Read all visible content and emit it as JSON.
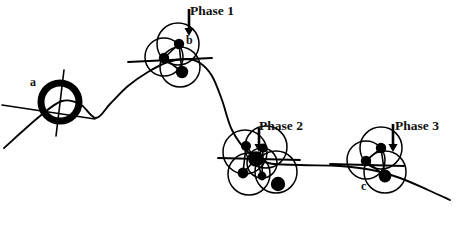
{
  "figure": {
    "type": "scientific-line-diagram",
    "background_color": "#ffffff",
    "ink_color": "#000000",
    "width": 456,
    "height": 229
  },
  "labels": {
    "phase1": "Phase 1",
    "phase2": "Phase 2",
    "phase3": "Phase 3",
    "a": "a",
    "b": "b",
    "c": "c"
  },
  "annotations": {
    "arrow1_name": "down-arrow-phase-1",
    "arrow2_name": "down-arrow-phase-2",
    "arrow3_name": "down-arrow-phase-3"
  },
  "chart_data": {
    "type": "scatter",
    "xlabel": "",
    "ylabel": "",
    "xlim": [
      0,
      456
    ],
    "ylim": [
      0,
      229
    ],
    "grid": false,
    "legend": "none",
    "trajectory": {
      "name": "main-path",
      "points": [
        [
          4,
          148
        ],
        [
          40,
          116
        ],
        [
          62,
          101
        ],
        [
          80,
          104
        ],
        [
          96,
          118
        ],
        [
          110,
          104
        ],
        [
          128,
          86
        ],
        [
          148,
          72
        ],
        [
          168,
          62
        ],
        [
          186,
          59
        ],
        [
          200,
          63
        ],
        [
          212,
          76
        ],
        [
          222,
          100
        ],
        [
          232,
          130
        ],
        [
          248,
          152
        ],
        [
          268,
          163
        ],
        [
          300,
          165
        ],
        [
          340,
          166
        ],
        [
          372,
          170
        ],
        [
          400,
          178
        ],
        [
          428,
          190
        ],
        [
          450,
          200
        ]
      ]
    },
    "clusters": [
      {
        "name": "node-a",
        "label": "a",
        "center": [
          60,
          102
        ],
        "ring": {
          "r": 19,
          "stroke_width": 7
        },
        "cross_lines": [
          {
            "x1": 2,
            "y1": 105,
            "x2": 95,
            "y2": 119
          },
          {
            "x1": 64,
            "y1": 70,
            "x2": 56,
            "y2": 136
          }
        ]
      },
      {
        "name": "phase-1-cluster",
        "label": "Phase 1",
        "arrow": {
          "x": 189,
          "y_start": 9,
          "y_end": 36
        },
        "circles": [
          {
            "cx": 178,
            "cy": 44,
            "r": 21
          },
          {
            "cx": 164,
            "cy": 57,
            "r": 19
          },
          {
            "cx": 180,
            "cy": 67,
            "r": 20
          }
        ],
        "dots": [
          {
            "cx": 179,
            "cy": 44,
            "r": 5.2
          },
          {
            "cx": 164,
            "cy": 58,
            "r": 5.2
          },
          {
            "cx": 182,
            "cy": 72,
            "r": 6.2
          }
        ],
        "bonds": [
          {
            "x1": 179,
            "y1": 44,
            "x2": 164,
            "y2": 58
          },
          {
            "x1": 179,
            "y1": 44,
            "x2": 182,
            "y2": 72
          },
          {
            "x1": 164,
            "y1": 58,
            "x2": 182,
            "y2": 72
          }
        ],
        "axis_line": {
          "x1": 128,
          "y1": 62,
          "x2": 212,
          "y2": 58
        }
      },
      {
        "name": "phase-2-cluster",
        "label": "Phase 2",
        "arrow": {
          "x": 259,
          "y_start": 128,
          "y_end": 152
        },
        "circles": [
          {
            "cx": 245,
            "cy": 152,
            "r": 22
          },
          {
            "cx": 266,
            "cy": 147,
            "r": 21
          },
          {
            "cx": 249,
            "cy": 174,
            "r": 21
          },
          {
            "cx": 276,
            "cy": 172,
            "r": 21
          },
          {
            "cx": 262,
            "cy": 163,
            "r": 15
          }
        ],
        "dots": [
          {
            "cx": 246,
            "cy": 146,
            "r": 5.0
          },
          {
            "cx": 263,
            "cy": 148,
            "r": 4.6
          },
          {
            "cx": 256,
            "cy": 159,
            "r": 7.8
          },
          {
            "cx": 243,
            "cy": 173,
            "r": 5.4
          },
          {
            "cx": 262,
            "cy": 176,
            "r": 4.4
          },
          {
            "cx": 278,
            "cy": 184,
            "r": 7.2
          }
        ],
        "bonds": [
          {
            "x1": 246,
            "y1": 146,
            "x2": 256,
            "y2": 159
          },
          {
            "x1": 263,
            "y1": 148,
            "x2": 256,
            "y2": 159
          },
          {
            "x1": 243,
            "y1": 173,
            "x2": 256,
            "y2": 159
          },
          {
            "x1": 262,
            "y1": 176,
            "x2": 256,
            "y2": 159
          },
          {
            "x1": 246,
            "y1": 146,
            "x2": 243,
            "y2": 173
          },
          {
            "x1": 263,
            "y1": 148,
            "x2": 262,
            "y2": 176
          }
        ],
        "axis_line": {
          "x1": 218,
          "y1": 158,
          "x2": 300,
          "y2": 160
        }
      },
      {
        "name": "phase-3-cluster",
        "label": "Phase 3",
        "arrow": {
          "x": 393,
          "y_start": 124,
          "y_end": 152
        },
        "circles": [
          {
            "cx": 381,
            "cy": 148,
            "r": 21
          },
          {
            "cx": 366,
            "cy": 160,
            "r": 19
          },
          {
            "cx": 385,
            "cy": 172,
            "r": 21
          }
        ],
        "dots": [
          {
            "cx": 381,
            "cy": 148,
            "r": 5.2
          },
          {
            "cx": 366,
            "cy": 161,
            "r": 5.2
          },
          {
            "cx": 385,
            "cy": 176,
            "r": 6.4
          }
        ],
        "bonds": [
          {
            "x1": 381,
            "y1": 148,
            "x2": 366,
            "y2": 161
          },
          {
            "x1": 381,
            "y1": 148,
            "x2": 385,
            "y2": 176
          },
          {
            "x1": 366,
            "y1": 161,
            "x2": 385,
            "y2": 176
          }
        ],
        "axis_line": {
          "x1": 330,
          "y1": 164,
          "x2": 404,
          "y2": 166
        }
      }
    ]
  }
}
